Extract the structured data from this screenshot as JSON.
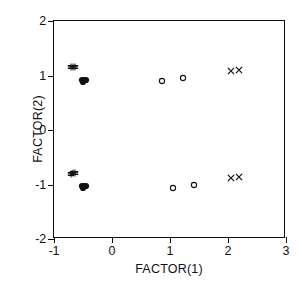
{
  "chart_data": {
    "type": "scatter",
    "title": "",
    "xlabel": "FACTOR(1)",
    "ylabel": "FACTOR(2)",
    "xlim": [
      -1,
      3
    ],
    "ylim": [
      -2,
      2
    ],
    "xticks": [
      -1,
      0,
      1,
      2,
      3
    ],
    "yticks": [
      -2,
      -1,
      0,
      1,
      2
    ],
    "xticklabels": [
      "-1",
      "0",
      "1",
      "2",
      "3"
    ],
    "yticklabels": [
      "-2",
      "-1",
      "0",
      "1",
      "2"
    ],
    "grid": false,
    "legend": null,
    "series": [
      {
        "name": "cross-cluster",
        "marker": "plus-cluster",
        "color": "#111111",
        "points": [
          {
            "x": -0.7,
            "y": 1.16
          },
          {
            "x": -0.67,
            "y": 1.15
          },
          {
            "x": -0.64,
            "y": 1.15
          },
          {
            "x": -0.7,
            "y": -0.8
          },
          {
            "x": -0.67,
            "y": -0.79
          },
          {
            "x": -0.64,
            "y": -0.79
          }
        ]
      },
      {
        "name": "filled-cluster",
        "marker": "filled-blob",
        "color": "#111111",
        "points": [
          {
            "x": -0.52,
            "y": 0.92
          },
          {
            "x": -0.48,
            "y": 0.92
          },
          {
            "x": -0.44,
            "y": 0.91
          },
          {
            "x": -0.5,
            "y": 0.88
          },
          {
            "x": -0.52,
            "y": -1.03
          },
          {
            "x": -0.48,
            "y": -1.03
          },
          {
            "x": -0.44,
            "y": -1.02
          },
          {
            "x": -0.5,
            "y": -1.06
          }
        ]
      },
      {
        "name": "open-circles",
        "marker": "open-circle",
        "color": "#111111",
        "points": [
          {
            "x": 0.87,
            "y": 0.9
          },
          {
            "x": 1.22,
            "y": 0.95
          },
          {
            "x": 1.05,
            "y": -1.06
          },
          {
            "x": 1.42,
            "y": -1.01
          }
        ]
      },
      {
        "name": "x-markers",
        "marker": "x-cross",
        "color": "#111111",
        "points": [
          {
            "x": 2.06,
            "y": 1.08
          },
          {
            "x": 2.19,
            "y": 1.1
          },
          {
            "x": 2.06,
            "y": -0.88
          },
          {
            "x": 2.19,
            "y": -0.87
          }
        ]
      }
    ]
  },
  "axes": {
    "frame_color": "#0d0d0d",
    "background": "#ffffff"
  }
}
